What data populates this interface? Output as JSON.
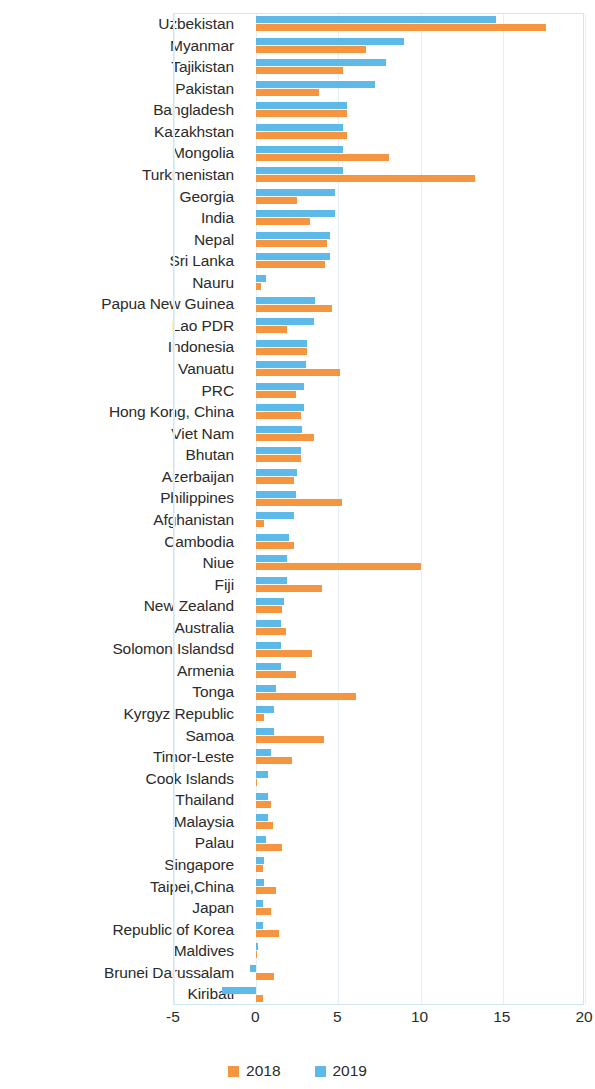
{
  "chart_data": {
    "type": "bar",
    "orientation": "horizontal",
    "title": "",
    "subtitle": "",
    "xlabel": "",
    "ylabel": "",
    "xlim": [
      -5,
      20
    ],
    "xticks": [
      "-5",
      "0",
      "5",
      "10",
      "15",
      "20"
    ],
    "grid": true,
    "legend_position": "bottom",
    "colors": {
      "2018": "#f5953f",
      "2019": "#5cb9e8"
    },
    "series": [
      {
        "name": "2018",
        "color": "#f5953f",
        "values": [
          17.6,
          6.7,
          5.3,
          3.8,
          5.5,
          5.5,
          8.1,
          13.3,
          2.5,
          3.3,
          4.3,
          4.2,
          0.3,
          4.6,
          1.9,
          3.1,
          5.1,
          2.4,
          2.7,
          3.5,
          2.7,
          2.3,
          5.2,
          0.5,
          2.3,
          10.0,
          4.0,
          1.6,
          1.8,
          3.4,
          2.4,
          6.1,
          0.5,
          4.1,
          2.2,
          0.05,
          0.9,
          1.0,
          1.6,
          0.4,
          1.2,
          0.9,
          1.4,
          0.0,
          1.1,
          0.4
        ]
      },
      {
        "name": "2019",
        "color": "#5cb9e8",
        "values": [
          14.6,
          9.0,
          7.9,
          7.2,
          5.5,
          5.3,
          5.3,
          5.3,
          4.8,
          4.8,
          4.5,
          4.5,
          0.6,
          3.6,
          3.5,
          3.1,
          3.0,
          2.9,
          2.9,
          2.8,
          2.7,
          2.5,
          2.4,
          2.3,
          2.0,
          1.9,
          1.9,
          1.7,
          1.5,
          1.5,
          1.5,
          1.2,
          1.1,
          1.1,
          0.9,
          0.7,
          0.7,
          0.7,
          0.6,
          0.5,
          0.5,
          0.4,
          0.4,
          0.1,
          -0.4,
          -2.1
        ]
      }
    ],
    "categories": [
      "Uzbekistan",
      "Myanmar",
      "Tajikistan",
      "Pakistan",
      "Bangladesh",
      "Kazakhstan",
      "Mongolia",
      "Turkmenistan",
      "Georgia",
      "India",
      "Nepal",
      "Sri Lanka",
      "Nauru",
      "Papua New Guinea",
      "Lao PDR",
      "Indonesia",
      "Vanuatu",
      "PRC",
      "Hong Kong, China",
      "Viet Nam",
      "Bhutan",
      "Azerbaijan",
      "Philippines",
      "Afghanistan",
      "Cambodia",
      "Niue",
      "Fiji",
      "New Zealand",
      "Australia",
      "Solomon Islandsd",
      "Armenia",
      "Tonga",
      "Kyrgyz Republic",
      "Samoa",
      "Timor-Leste",
      "Cook Islands",
      "Thailand",
      "Malaysia",
      "Palau",
      "Singapore",
      "Taipei,China",
      "Japan",
      "Republic of Korea",
      "Maldives",
      "Brunei Darussalam",
      "Kiribati"
    ]
  },
  "legend": {
    "items": [
      {
        "label": "2018",
        "color": "#f5953f"
      },
      {
        "label": "2019",
        "color": "#5cb9e8"
      }
    ]
  }
}
